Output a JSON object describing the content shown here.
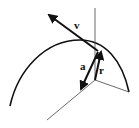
{
  "diagram": {
    "labels": {
      "velocity": "v",
      "acceleration": "a",
      "radius": "r"
    },
    "colors": {
      "stroke": "#111111",
      "thin_line": "#444444",
      "background": "#ffffff"
    }
  }
}
